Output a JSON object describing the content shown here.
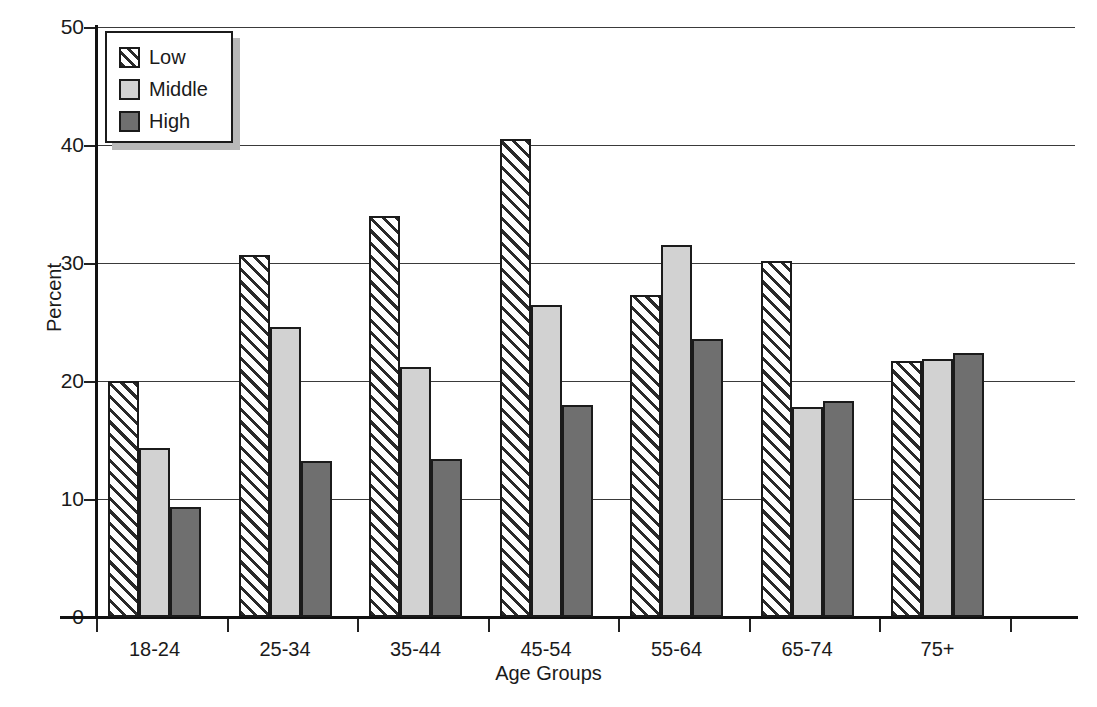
{
  "chart_data": {
    "type": "bar",
    "title": "",
    "xlabel": "Age Groups",
    "ylabel": "Percent",
    "categories": [
      "18-24",
      "25-34",
      "35-44",
      "45-54",
      "55-64",
      "65-74",
      "75+"
    ],
    "series": [
      {
        "name": "Low",
        "values": [
          20.0,
          30.7,
          34.0,
          40.5,
          27.3,
          30.2,
          21.7
        ]
      },
      {
        "name": "Middle",
        "values": [
          14.3,
          24.6,
          21.2,
          26.4,
          31.5,
          17.8,
          21.9
        ]
      },
      {
        "name": "High",
        "values": [
          9.3,
          13.2,
          13.4,
          18.0,
          23.6,
          18.3,
          22.4
        ]
      }
    ],
    "ylim": [
      0,
      50
    ],
    "yticks": [
      0,
      10,
      20,
      30,
      40,
      50
    ],
    "ytick_labels": [
      "0",
      "10",
      "20",
      "30",
      "40",
      "50"
    ],
    "grid": true,
    "grid_axis": "y",
    "legend_position": "upper-left",
    "legend_entries": [
      "Low",
      "Middle",
      "High"
    ],
    "colors": {
      "low": "#ffffff",
      "low_hatch": "#2a2a2a",
      "middle": "#d2d2d2",
      "high": "#6f6f6f",
      "outline": "#1b1b1b",
      "grid": "#3a3a3a",
      "axis": "#111111",
      "text": "#1a1a1a",
      "background": "#ffffff"
    }
  }
}
